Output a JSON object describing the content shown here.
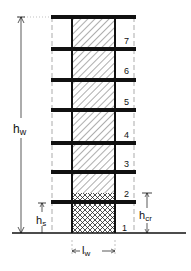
{
  "diagram": {
    "colors": {
      "ink": "#111111",
      "background": "#ffffff",
      "dim": "#999999"
    },
    "floors": [
      {
        "label": "1"
      },
      {
        "label": "2"
      },
      {
        "label": "3"
      },
      {
        "label": "4"
      },
      {
        "label": "5"
      },
      {
        "label": "6"
      },
      {
        "label": "7"
      }
    ],
    "dimensions": {
      "total_height": {
        "main": "h",
        "sub": "w"
      },
      "storey_height": {
        "main": "h",
        "sub": "s"
      },
      "critical_height": {
        "main": "h",
        "sub": "cr"
      },
      "wall_length": {
        "main": "l",
        "sub": "w"
      }
    },
    "legend": {
      "hatch_single": "elastic region",
      "hatch_cross": "critical region"
    }
  }
}
